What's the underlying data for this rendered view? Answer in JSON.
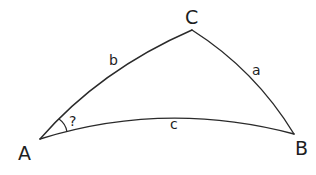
{
  "diagram": {
    "type": "spherical-triangle",
    "vertices": {
      "A": {
        "label": "A",
        "x": 40,
        "y": 139
      },
      "B": {
        "label": "B",
        "x": 294,
        "y": 134
      },
      "C": {
        "label": "C",
        "x": 192,
        "y": 30
      }
    },
    "sides": {
      "a": {
        "label": "a",
        "from": "C",
        "to": "B"
      },
      "b": {
        "label": "b",
        "from": "A",
        "to": "C"
      },
      "c": {
        "label": "c",
        "from": "A",
        "to": "B"
      }
    },
    "angle_marker": {
      "at": "A",
      "label": "?"
    },
    "stroke_color": "#2a2a2a",
    "background": "#ffffff"
  }
}
